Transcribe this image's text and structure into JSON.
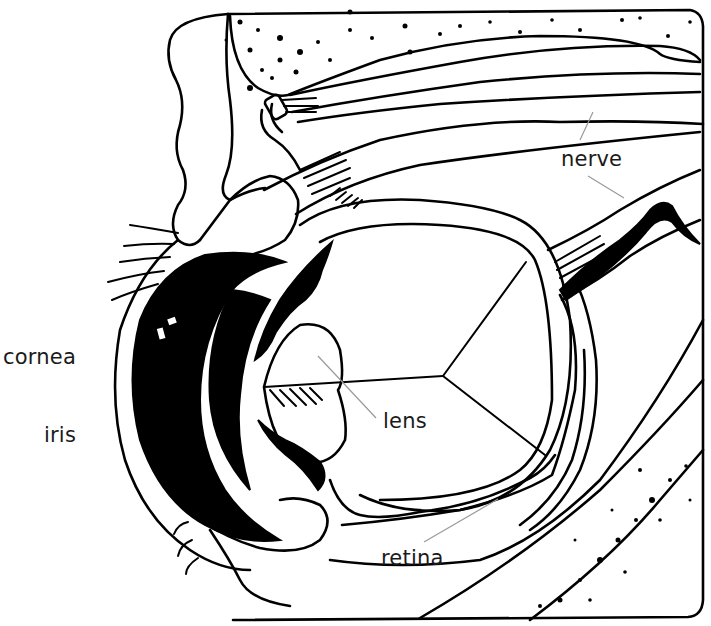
{
  "diagram": {
    "labels": {
      "nerve": "nerve",
      "cornea": "cornea",
      "iris": "iris",
      "lens": "lens",
      "retina": "retina"
    },
    "colors": {
      "ink": "#000000",
      "background": "#ffffff",
      "label_text": "#1a1a1a",
      "pointer_line": "#9a9a9a"
    }
  }
}
